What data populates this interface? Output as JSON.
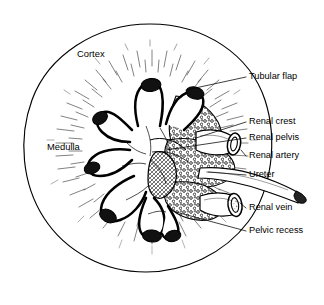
{
  "figure": {
    "background_color": "#ffffff",
    "ink_color": "#000000",
    "width": 324,
    "height": 305
  },
  "labels": {
    "cortex": "Cortex",
    "medulla": "Medulla",
    "tubular_flap": "Tubular flap",
    "renal_crest": "Renal crest",
    "renal_pelvis": "Renal pelvis",
    "renal_artery": "Renal artery",
    "ureter": "Ureter",
    "renal_vein": "Renal vein",
    "pelvic_recess": "Pelvic recess"
  },
  "structures": [
    {
      "name": "renal-capsule",
      "label": "Cortex",
      "label_position": "inside-upper-left"
    },
    {
      "name": "medulla-region",
      "label": "Medulla",
      "label_position": "inside-left"
    },
    {
      "name": "tubular-flap",
      "label": "Tubular flap",
      "label_position": "right"
    },
    {
      "name": "renal-crest",
      "label": "Renal crest",
      "label_position": "right"
    },
    {
      "name": "renal-pelvis",
      "label": "Renal pelvis",
      "label_position": "right"
    },
    {
      "name": "renal-artery",
      "label": "Renal artery",
      "label_position": "right"
    },
    {
      "name": "ureter",
      "label": "Ureter",
      "label_position": "right"
    },
    {
      "name": "renal-vein",
      "label": "Renal vein",
      "label_position": "right"
    },
    {
      "name": "pelvic-recess",
      "label": "Pelvic recess",
      "label_position": "right"
    }
  ]
}
